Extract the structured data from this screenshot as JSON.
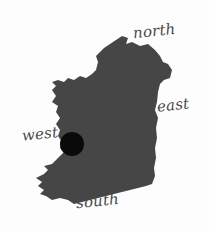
{
  "map": {
    "subject": "Ireland",
    "fill_color": "#464646",
    "marker_color": "#0a0a0a",
    "background_color": "#fdfdfd",
    "label_color": "#4a4a4a",
    "marker": {
      "cx": 72,
      "cy": 144,
      "r": 12
    }
  },
  "labels": {
    "north": "north",
    "east": "east",
    "west": "west",
    "south": "south"
  }
}
